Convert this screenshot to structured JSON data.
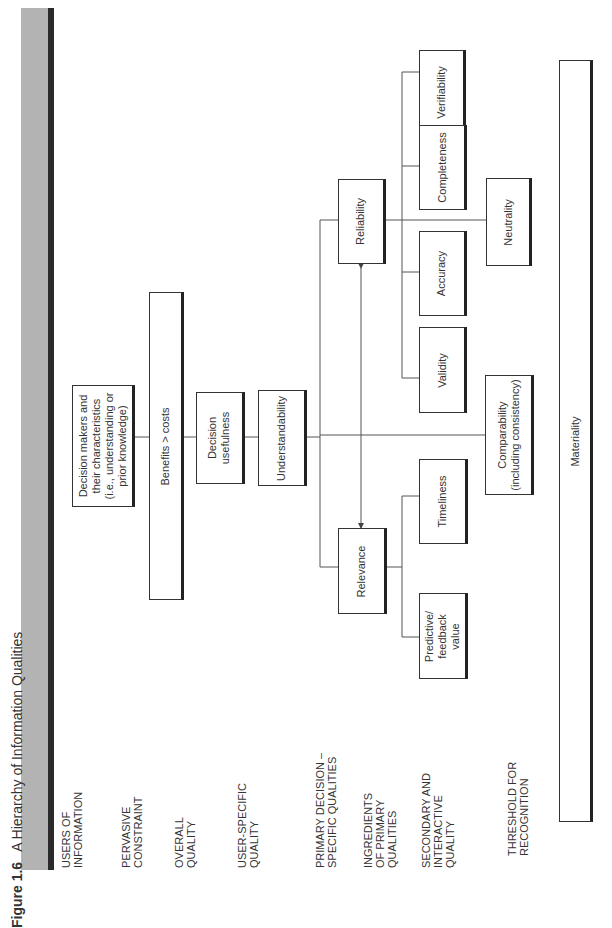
{
  "figure": {
    "label": "Figure 1.6",
    "title": "A Hierarchy of Information Qualities",
    "header_bar_color": "#b3b3b3"
  },
  "row_labels": [
    {
      "id": "users",
      "text": "USERS OF\nINFORMATION"
    },
    {
      "id": "pervasive",
      "text": "PERVASIVE\nCONSTRAINT"
    },
    {
      "id": "overall",
      "text": "OVERALL\nQUALITY"
    },
    {
      "id": "user_specific",
      "text": "USER-SPECIFIC\nQUALITY"
    },
    {
      "id": "primary",
      "text": "PRIMARY DECISION –\nSPECIFIC QUALITIES"
    },
    {
      "id": "ingredients",
      "text": "INGREDIENTS\nOF PRIMARY\nQUALITIES"
    },
    {
      "id": "secondary",
      "text": "SECONDARY AND\nINTERACTIVE\nQUALITY"
    },
    {
      "id": "threshold",
      "text": "THRESHOLD FOR\nRECOGNITION"
    }
  ],
  "nodes": {
    "decision_makers": "Decision makers and\ntheir characteristics\n(i.e., understanding or\nprior knowledge)",
    "benefits_costs": "Benefits > costs",
    "decision_usefulness": "Decision\nusefulness",
    "understandability": "Understandability",
    "relevance": "Relevance",
    "reliability": "Reliability",
    "predictive_feedback": "Predictive/\nfeedback\nvalue",
    "timeliness": "Timeliness",
    "validity": "Validity",
    "accuracy": "Accuracy",
    "completeness": "Completeness",
    "verifiability": "Verifiability",
    "neutrality": "Neutrality",
    "comparability": "Comparability\n(including consistency)",
    "materiality": "Materiality"
  },
  "edges": [
    [
      "decision_makers",
      "benefits_costs"
    ],
    [
      "benefits_costs",
      "decision_usefulness"
    ],
    [
      "decision_usefulness",
      "understandability"
    ],
    [
      "understandability",
      "relevance"
    ],
    [
      "understandability",
      "reliability"
    ],
    [
      "relevance",
      "reliability",
      "bidirectional"
    ],
    [
      "relevance",
      "predictive_feedback"
    ],
    [
      "relevance",
      "timeliness"
    ],
    [
      "reliability",
      "validity"
    ],
    [
      "reliability",
      "accuracy"
    ],
    [
      "reliability",
      "completeness"
    ],
    [
      "reliability",
      "verifiability"
    ],
    [
      "reliability",
      "neutrality"
    ],
    [
      "understandability",
      "comparability"
    ]
  ]
}
